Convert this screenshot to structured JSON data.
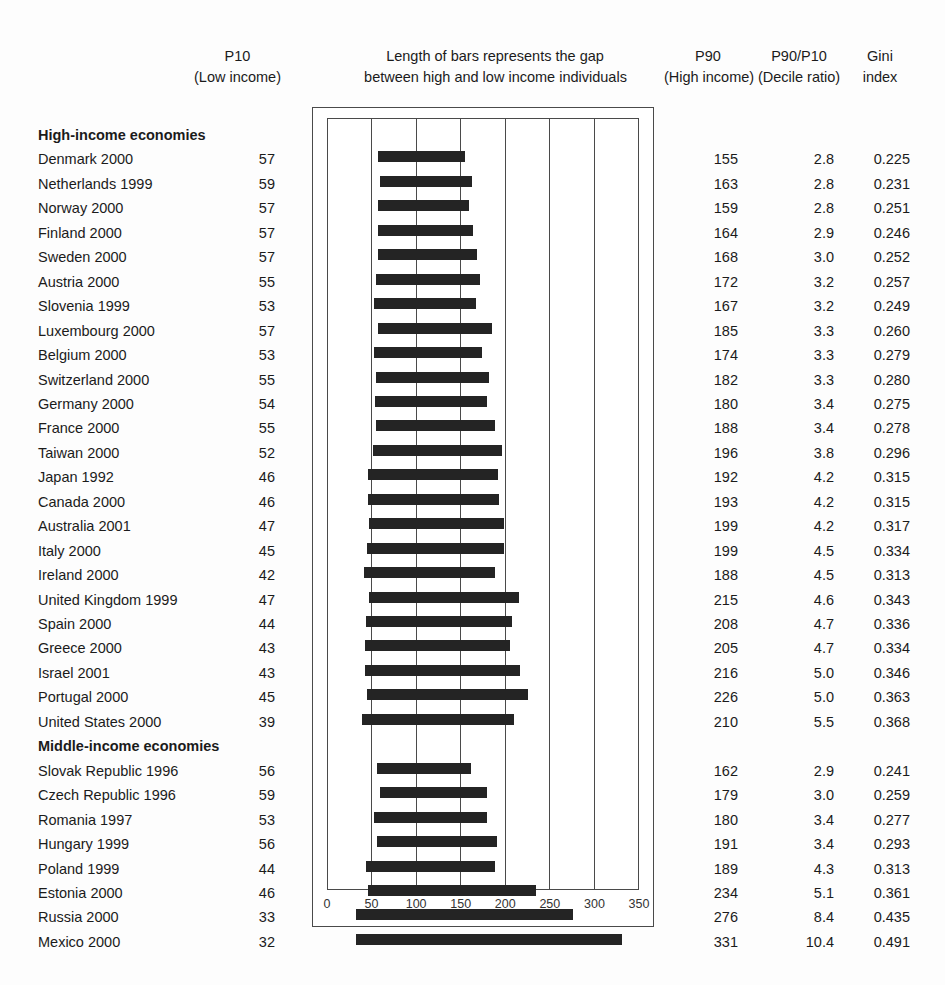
{
  "headers": {
    "p10_line1": "P10",
    "p10_line2": "(Low income)",
    "middle_line1": "Length of bars represents the gap",
    "middle_line2": "between high and low income individuals",
    "p90_line1": "P90",
    "p90_line2": "(High income)",
    "ratio_line1": "P90/P10",
    "ratio_line2": "(Decile ratio)",
    "gini_line1": "Gini",
    "gini_line2": "index"
  },
  "groups": [
    {
      "label": "High-income economies"
    },
    {
      "label": "Middle-income economies"
    }
  ],
  "chart_data": {
    "type": "bar",
    "title": "Length of bars represents the gap between high and low income individuals",
    "xlabel": "",
    "ylabel": "",
    "xlim": [
      0,
      350
    ],
    "xticks": [
      0,
      50,
      100,
      150,
      200,
      250,
      300,
      350
    ],
    "ticklabels": [
      "0",
      "50",
      "100",
      "150",
      "200",
      "250",
      "300",
      "350"
    ],
    "grid": true,
    "orientation": "horizontal",
    "bar_type": "floating-range",
    "series": [
      {
        "name": "P10 (Low income)",
        "role": "bar_start"
      },
      {
        "name": "P90 (High income)",
        "role": "bar_end"
      }
    ],
    "columns": [
      "Economy",
      "P10",
      "P90",
      "P90/P10",
      "Gini index"
    ],
    "rows": [
      {
        "group": "High-income economies",
        "label": "Denmark 2000",
        "p10": 57,
        "p90": 155,
        "ratio": "2.8",
        "gini": "0.225"
      },
      {
        "group": "High-income economies",
        "label": "Netherlands 1999",
        "p10": 59,
        "p90": 163,
        "ratio": "2.8",
        "gini": "0.231"
      },
      {
        "group": "High-income economies",
        "label": "Norway 2000",
        "p10": 57,
        "p90": 159,
        "ratio": "2.8",
        "gini": "0.251"
      },
      {
        "group": "High-income economies",
        "label": "Finland 2000",
        "p10": 57,
        "p90": 164,
        "ratio": "2.9",
        "gini": "0.246"
      },
      {
        "group": "High-income economies",
        "label": "Sweden 2000",
        "p10": 57,
        "p90": 168,
        "ratio": "3.0",
        "gini": "0.252"
      },
      {
        "group": "High-income economies",
        "label": "Austria 2000",
        "p10": 55,
        "p90": 172,
        "ratio": "3.2",
        "gini": "0.257"
      },
      {
        "group": "High-income economies",
        "label": "Slovenia 1999",
        "p10": 53,
        "p90": 167,
        "ratio": "3.2",
        "gini": "0.249"
      },
      {
        "group": "High-income economies",
        "label": "Luxembourg 2000",
        "p10": 57,
        "p90": 185,
        "ratio": "3.3",
        "gini": "0.260"
      },
      {
        "group": "High-income economies",
        "label": "Belgium 2000",
        "p10": 53,
        "p90": 174,
        "ratio": "3.3",
        "gini": "0.279"
      },
      {
        "group": "High-income economies",
        "label": "Switzerland 2000",
        "p10": 55,
        "p90": 182,
        "ratio": "3.3",
        "gini": "0.280"
      },
      {
        "group": "High-income economies",
        "label": "Germany 2000",
        "p10": 54,
        "p90": 180,
        "ratio": "3.4",
        "gini": "0.275"
      },
      {
        "group": "High-income economies",
        "label": "France 2000",
        "p10": 55,
        "p90": 188,
        "ratio": "3.4",
        "gini": "0.278"
      },
      {
        "group": "High-income economies",
        "label": "Taiwan 2000",
        "p10": 52,
        "p90": 196,
        "ratio": "3.8",
        "gini": "0.296"
      },
      {
        "group": "High-income economies",
        "label": "Japan 1992",
        "p10": 46,
        "p90": 192,
        "ratio": "4.2",
        "gini": "0.315"
      },
      {
        "group": "High-income economies",
        "label": "Canada 2000",
        "p10": 46,
        "p90": 193,
        "ratio": "4.2",
        "gini": "0.315"
      },
      {
        "group": "High-income economies",
        "label": "Australia 2001",
        "p10": 47,
        "p90": 199,
        "ratio": "4.2",
        "gini": "0.317"
      },
      {
        "group": "High-income economies",
        "label": "Italy 2000",
        "p10": 45,
        "p90": 199,
        "ratio": "4.5",
        "gini": "0.334"
      },
      {
        "group": "High-income economies",
        "label": "Ireland 2000",
        "p10": 42,
        "p90": 188,
        "ratio": "4.5",
        "gini": "0.313"
      },
      {
        "group": "High-income economies",
        "label": "United Kingdom 1999",
        "p10": 47,
        "p90": 215,
        "ratio": "4.6",
        "gini": "0.343"
      },
      {
        "group": "High-income economies",
        "label": "Spain 2000",
        "p10": 44,
        "p90": 208,
        "ratio": "4.7",
        "gini": "0.336"
      },
      {
        "group": "High-income economies",
        "label": "Greece 2000",
        "p10": 43,
        "p90": 205,
        "ratio": "4.7",
        "gini": "0.334"
      },
      {
        "group": "High-income economies",
        "label": "Israel 2001",
        "p10": 43,
        "p90": 216,
        "ratio": "5.0",
        "gini": "0.346"
      },
      {
        "group": "High-income economies",
        "label": "Portugal 2000",
        "p10": 45,
        "p90": 226,
        "ratio": "5.0",
        "gini": "0.363"
      },
      {
        "group": "High-income economies",
        "label": "United States 2000",
        "p10": 39,
        "p90": 210,
        "ratio": "5.5",
        "gini": "0.368"
      },
      {
        "group": "Middle-income economies",
        "label": "Slovak Republic 1996",
        "p10": 56,
        "p90": 162,
        "ratio": "2.9",
        "gini": "0.241"
      },
      {
        "group": "Middle-income economies",
        "label": "Czech Republic 1996",
        "p10": 59,
        "p90": 179,
        "ratio": "3.0",
        "gini": "0.259"
      },
      {
        "group": "Middle-income economies",
        "label": "Romania 1997",
        "p10": 53,
        "p90": 180,
        "ratio": "3.4",
        "gini": "0.277"
      },
      {
        "group": "Middle-income economies",
        "label": "Hungary 1999",
        "p10": 56,
        "p90": 191,
        "ratio": "3.4",
        "gini": "0.293"
      },
      {
        "group": "Middle-income economies",
        "label": "Poland 1999",
        "p10": 44,
        "p90": 189,
        "ratio": "4.3",
        "gini": "0.313"
      },
      {
        "group": "Middle-income economies",
        "label": "Estonia 2000",
        "p10": 46,
        "p90": 234,
        "ratio": "5.1",
        "gini": "0.361"
      },
      {
        "group": "Middle-income economies",
        "label": "Russia 2000",
        "p10": 33,
        "p90": 276,
        "ratio": "8.4",
        "gini": "0.435"
      },
      {
        "group": "Middle-income economies",
        "label": "Mexico 2000",
        "p10": 32,
        "p90": 331,
        "ratio": "10.4",
        "gini": "0.491"
      }
    ]
  }
}
